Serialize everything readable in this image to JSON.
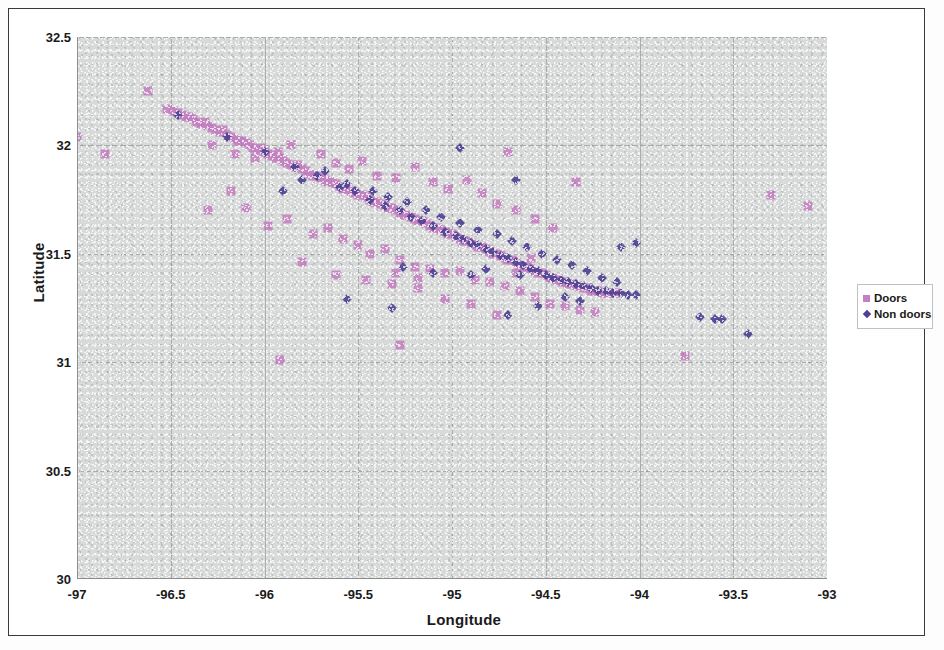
{
  "chart_data": {
    "type": "scatter",
    "title": "",
    "xlabel": "Longitude",
    "ylabel": "Latitude",
    "xlim": [
      -97,
      -93
    ],
    "ylim": [
      30,
      32.5
    ],
    "xticks": [
      "-97",
      "-96.5",
      "-96",
      "-95.5",
      "-95",
      "-94.5",
      "-94",
      "-93.5",
      "-93"
    ],
    "yticks": [
      "30",
      "30.5",
      "31",
      "31.5",
      "32",
      "32.5"
    ],
    "grid": true,
    "legend_position": "right",
    "series": [
      {
        "name": "Doors",
        "marker": "square",
        "color": "#c47fc0",
        "points": [
          [
            -97.0,
            32.04
          ],
          [
            -96.85,
            31.96
          ],
          [
            -96.62,
            32.25
          ],
          [
            -96.52,
            32.17
          ],
          [
            -96.49,
            32.16
          ],
          [
            -96.46,
            32.15
          ],
          [
            -96.44,
            32.14
          ],
          [
            -96.42,
            32.13
          ],
          [
            -96.4,
            32.13
          ],
          [
            -96.38,
            32.12
          ],
          [
            -96.36,
            32.11
          ],
          [
            -96.34,
            32.1
          ],
          [
            -96.32,
            32.11
          ],
          [
            -96.3,
            32.09
          ],
          [
            -96.28,
            32.08
          ],
          [
            -96.26,
            32.07
          ],
          [
            -96.24,
            32.06
          ],
          [
            -96.22,
            32.07
          ],
          [
            -96.2,
            32.05
          ],
          [
            -96.18,
            32.04
          ],
          [
            -96.16,
            32.03
          ],
          [
            -96.14,
            32.02
          ],
          [
            -96.12,
            32.02
          ],
          [
            -96.1,
            32.01
          ],
          [
            -96.08,
            32.0
          ],
          [
            -96.06,
            31.99
          ],
          [
            -96.04,
            31.98
          ],
          [
            -96.02,
            31.99
          ],
          [
            -96.0,
            31.97
          ],
          [
            -95.98,
            31.96
          ],
          [
            -95.96,
            31.95
          ],
          [
            -95.94,
            31.94
          ],
          [
            -95.92,
            31.94
          ],
          [
            -95.9,
            31.93
          ],
          [
            -95.88,
            31.92
          ],
          [
            -95.86,
            31.91
          ],
          [
            -95.84,
            31.9
          ],
          [
            -95.82,
            31.91
          ],
          [
            -95.8,
            31.89
          ],
          [
            -95.78,
            31.88
          ],
          [
            -95.76,
            31.87
          ],
          [
            -95.74,
            31.86
          ],
          [
            -95.72,
            31.86
          ],
          [
            -95.7,
            31.85
          ],
          [
            -95.68,
            31.84
          ],
          [
            -95.66,
            31.83
          ],
          [
            -95.64,
            31.83
          ],
          [
            -95.62,
            31.82
          ],
          [
            -95.6,
            31.81
          ],
          [
            -95.58,
            31.8
          ],
          [
            -95.56,
            31.8
          ],
          [
            -95.54,
            31.79
          ],
          [
            -95.52,
            31.78
          ],
          [
            -95.5,
            31.77
          ],
          [
            -95.48,
            31.77
          ],
          [
            -95.46,
            31.76
          ],
          [
            -95.44,
            31.75
          ],
          [
            -95.42,
            31.74
          ],
          [
            -95.4,
            31.74
          ],
          [
            -95.38,
            31.73
          ],
          [
            -95.36,
            31.72
          ],
          [
            -95.34,
            31.71
          ],
          [
            -95.32,
            31.71
          ],
          [
            -95.3,
            31.7
          ],
          [
            -95.28,
            31.69
          ],
          [
            -95.26,
            31.68
          ],
          [
            -95.24,
            31.68
          ],
          [
            -95.22,
            31.67
          ],
          [
            -95.2,
            31.66
          ],
          [
            -95.18,
            31.65
          ],
          [
            -95.16,
            31.65
          ],
          [
            -95.14,
            31.64
          ],
          [
            -95.12,
            31.63
          ],
          [
            -95.1,
            31.62
          ],
          [
            -95.08,
            31.62
          ],
          [
            -95.06,
            31.61
          ],
          [
            -95.04,
            31.6
          ],
          [
            -95.02,
            31.59
          ],
          [
            -95.0,
            31.59
          ],
          [
            -94.98,
            31.58
          ],
          [
            -94.96,
            31.57
          ],
          [
            -94.94,
            31.56
          ],
          [
            -94.92,
            31.56
          ],
          [
            -94.9,
            31.55
          ],
          [
            -94.88,
            31.54
          ],
          [
            -94.86,
            31.53
          ],
          [
            -94.84,
            31.53
          ],
          [
            -94.82,
            31.52
          ],
          [
            -94.8,
            31.51
          ],
          [
            -94.78,
            31.5
          ],
          [
            -94.76,
            31.5
          ],
          [
            -94.74,
            31.49
          ],
          [
            -94.72,
            31.48
          ],
          [
            -94.7,
            31.47
          ],
          [
            -94.68,
            31.47
          ],
          [
            -94.66,
            31.46
          ],
          [
            -94.64,
            31.45
          ],
          [
            -94.62,
            31.44
          ],
          [
            -94.6,
            31.44
          ],
          [
            -94.58,
            31.43
          ],
          [
            -94.56,
            31.42
          ],
          [
            -94.54,
            31.41
          ],
          [
            -94.52,
            31.41
          ],
          [
            -94.5,
            31.4
          ],
          [
            -94.48,
            31.39
          ],
          [
            -94.46,
            31.39
          ],
          [
            -94.44,
            31.38
          ],
          [
            -94.42,
            31.37
          ],
          [
            -94.4,
            31.37
          ],
          [
            -94.38,
            31.36
          ],
          [
            -94.36,
            31.36
          ],
          [
            -94.34,
            31.35
          ],
          [
            -94.32,
            31.35
          ],
          [
            -94.3,
            31.34
          ],
          [
            -94.28,
            31.34
          ],
          [
            -94.26,
            31.33
          ],
          [
            -94.24,
            31.33
          ],
          [
            -94.22,
            31.33
          ],
          [
            -94.2,
            31.32
          ],
          [
            -94.18,
            31.32
          ],
          [
            -94.16,
            31.32
          ],
          [
            -94.14,
            31.32
          ],
          [
            -94.12,
            31.32
          ],
          [
            -96.28,
            32.0
          ],
          [
            -96.16,
            31.96
          ],
          [
            -96.05,
            31.94
          ],
          [
            -95.93,
            31.97
          ],
          [
            -95.86,
            32.0
          ],
          [
            -95.7,
            31.96
          ],
          [
            -95.62,
            31.92
          ],
          [
            -95.55,
            31.89
          ],
          [
            -95.48,
            31.93
          ],
          [
            -95.4,
            31.86
          ],
          [
            -95.3,
            31.85
          ],
          [
            -95.2,
            31.9
          ],
          [
            -95.1,
            31.83
          ],
          [
            -95.02,
            31.8
          ],
          [
            -94.92,
            31.84
          ],
          [
            -94.84,
            31.78
          ],
          [
            -94.76,
            31.73
          ],
          [
            -94.66,
            31.7
          ],
          [
            -94.56,
            31.66
          ],
          [
            -94.46,
            31.62
          ],
          [
            -96.3,
            31.7
          ],
          [
            -96.1,
            31.71
          ],
          [
            -95.98,
            31.63
          ],
          [
            -95.88,
            31.66
          ],
          [
            -95.74,
            31.59
          ],
          [
            -95.66,
            31.62
          ],
          [
            -95.58,
            31.57
          ],
          [
            -95.5,
            31.54
          ],
          [
            -95.44,
            31.5
          ],
          [
            -95.36,
            31.52
          ],
          [
            -95.28,
            31.47
          ],
          [
            -95.2,
            31.44
          ],
          [
            -95.12,
            31.43
          ],
          [
            -95.04,
            31.41
          ],
          [
            -94.96,
            31.42
          ],
          [
            -94.88,
            31.38
          ],
          [
            -94.8,
            31.37
          ],
          [
            -94.72,
            31.35
          ],
          [
            -94.64,
            31.33
          ],
          [
            -94.56,
            31.3
          ],
          [
            -94.48,
            31.27
          ],
          [
            -94.4,
            31.26
          ],
          [
            -94.32,
            31.24
          ],
          [
            -94.24,
            31.23
          ],
          [
            -95.8,
            31.46
          ],
          [
            -95.62,
            31.4
          ],
          [
            -95.46,
            31.38
          ],
          [
            -95.32,
            31.36
          ],
          [
            -95.18,
            31.34
          ],
          [
            -95.04,
            31.29
          ],
          [
            -94.9,
            31.27
          ],
          [
            -94.76,
            31.22
          ],
          [
            -95.92,
            31.01
          ],
          [
            -95.28,
            31.08
          ],
          [
            -93.76,
            31.03
          ],
          [
            -93.3,
            31.77
          ],
          [
            -93.1,
            31.72
          ],
          [
            -94.34,
            31.83
          ],
          [
            -94.7,
            31.97
          ],
          [
            -96.18,
            31.79
          ],
          [
            -95.18,
            31.39
          ],
          [
            -95.3,
            31.41
          ],
          [
            -94.66,
            31.41
          ],
          [
            -94.58,
            31.48
          ]
        ]
      },
      {
        "name": "Non doors",
        "marker": "diamond",
        "color": "#4e4193",
        "points": [
          [
            -96.46,
            32.14
          ],
          [
            -96.2,
            32.04
          ],
          [
            -96.0,
            31.97
          ],
          [
            -95.84,
            31.9
          ],
          [
            -95.72,
            31.86
          ],
          [
            -95.6,
            31.81
          ],
          [
            -95.52,
            31.79
          ],
          [
            -95.44,
            31.75
          ],
          [
            -95.36,
            31.72
          ],
          [
            -95.28,
            31.7
          ],
          [
            -95.22,
            31.67
          ],
          [
            -95.16,
            31.65
          ],
          [
            -95.1,
            31.63
          ],
          [
            -95.04,
            31.6
          ],
          [
            -94.98,
            31.58
          ],
          [
            -94.94,
            31.57
          ],
          [
            -94.9,
            31.55
          ],
          [
            -94.86,
            31.54
          ],
          [
            -94.82,
            31.52
          ],
          [
            -94.78,
            31.51
          ],
          [
            -94.74,
            31.49
          ],
          [
            -94.7,
            31.48
          ],
          [
            -94.66,
            31.46
          ],
          [
            -94.62,
            31.45
          ],
          [
            -94.58,
            31.43
          ],
          [
            -94.54,
            31.42
          ],
          [
            -94.5,
            31.4
          ],
          [
            -94.46,
            31.39
          ],
          [
            -94.42,
            31.38
          ],
          [
            -94.38,
            31.37
          ],
          [
            -94.34,
            31.36
          ],
          [
            -94.3,
            31.35
          ],
          [
            -94.26,
            31.34
          ],
          [
            -94.22,
            31.33
          ],
          [
            -94.18,
            31.33
          ],
          [
            -94.14,
            31.32
          ],
          [
            -94.1,
            31.32
          ],
          [
            -94.06,
            31.31
          ],
          [
            -94.02,
            31.31
          ],
          [
            -95.8,
            31.84
          ],
          [
            -95.68,
            31.88
          ],
          [
            -95.56,
            31.82
          ],
          [
            -95.42,
            31.79
          ],
          [
            -95.34,
            31.76
          ],
          [
            -95.24,
            31.74
          ],
          [
            -95.14,
            31.7
          ],
          [
            -95.06,
            31.67
          ],
          [
            -94.96,
            31.64
          ],
          [
            -94.86,
            31.61
          ],
          [
            -94.76,
            31.59
          ],
          [
            -94.68,
            31.56
          ],
          [
            -94.6,
            31.53
          ],
          [
            -94.52,
            31.5
          ],
          [
            -94.44,
            31.47
          ],
          [
            -94.36,
            31.45
          ],
          [
            -94.28,
            31.42
          ],
          [
            -94.2,
            31.39
          ],
          [
            -94.12,
            31.37
          ],
          [
            -95.56,
            31.29
          ],
          [
            -95.32,
            31.25
          ],
          [
            -94.7,
            31.22
          ],
          [
            -94.64,
            31.4
          ],
          [
            -94.54,
            31.26
          ],
          [
            -94.96,
            31.99
          ],
          [
            -94.66,
            31.84
          ],
          [
            -95.1,
            31.41
          ],
          [
            -93.68,
            31.21
          ],
          [
            -93.6,
            31.2
          ],
          [
            -93.56,
            31.2
          ],
          [
            -93.42,
            31.13
          ],
          [
            -94.02,
            31.55
          ],
          [
            -94.1,
            31.53
          ],
          [
            -95.9,
            31.79
          ],
          [
            -95.26,
            31.44
          ],
          [
            -94.9,
            31.4
          ],
          [
            -94.82,
            31.43
          ],
          [
            -94.4,
            31.3
          ],
          [
            -94.32,
            31.28
          ]
        ]
      }
    ]
  },
  "legend": {
    "items": [
      {
        "label": "Doors",
        "marker": "square"
      },
      {
        "label": "Non doors",
        "marker": "diamond"
      }
    ]
  }
}
